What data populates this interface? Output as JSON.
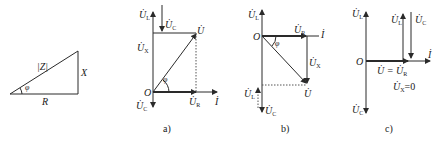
{
  "impedance_triangle": {
    "hypotenuse": "|Z|",
    "vertical_side": "X",
    "base": "R",
    "angle": "φ"
  },
  "panel_a": {
    "caption": "a)",
    "origin": "O",
    "labels": {
      "UL": "U̇",
      "UL_sub": "L",
      "UC_top": "U̇",
      "UC_top_sub": "C",
      "UX": "U̇",
      "UX_sub": "X",
      "U": "U̇",
      "UR": "U̇",
      "UR_sub": "R",
      "I": "İ",
      "UC_bottom": "U̇",
      "UC_bottom_sub": "C",
      "angle": "φ"
    }
  },
  "panel_b": {
    "caption": "b)",
    "origin": "O",
    "labels": {
      "UL_top": "U̇",
      "UL_top_sub": "L",
      "UR": "U̇",
      "UR_sub": "R",
      "I": "İ",
      "UX": "U̇",
      "UX_sub": "X",
      "U": "U̇",
      "UL_bottom": "U̇",
      "UL_bottom_sub": "L",
      "UC": "U̇",
      "UC_sub": "C",
      "angle": "φ"
    }
  },
  "panel_c": {
    "caption": "c)",
    "origin": "O",
    "labels": {
      "UL_axis": "U̇",
      "UL_axis_sub": "L",
      "UL_mid": "U̇",
      "UL_mid_sub": "L",
      "UC_mid": "U̇",
      "UC_mid_sub": "C",
      "I": "İ",
      "U_eq": "U̇ = U̇",
      "U_eq_sub": "R",
      "UX_zero": "U̇",
      "UX_zero_sub": "X",
      "UX_zero_val": "=0",
      "UC_bottom": "U̇",
      "UC_bottom_sub": "C"
    }
  },
  "colors": {
    "line": "#2a2a2a",
    "dotted": "#555555"
  }
}
